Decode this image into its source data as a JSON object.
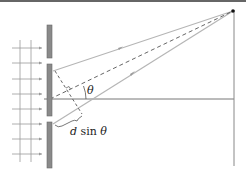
{
  "diagram": {
    "labels": {
      "theta": "θ",
      "path_difference_d": "d",
      "path_difference_sin": " sin ",
      "path_difference_theta": "θ"
    },
    "colors": {
      "barrier": "#8a8a8a",
      "barrier_stroke": "#6a6a6a",
      "ray": "#b5b5b5",
      "dashed_line": "#555555",
      "axis": "#777777",
      "screen": "#888888",
      "wavefront": "#9a9a9a",
      "top_border": "#666666",
      "point": "#111111",
      "text": "#222222"
    },
    "elements": {
      "incoming_wavefronts": 8,
      "barrier_segments": 3,
      "slits": 2,
      "rays_to_screen": 2,
      "screen_point": "P"
    }
  }
}
